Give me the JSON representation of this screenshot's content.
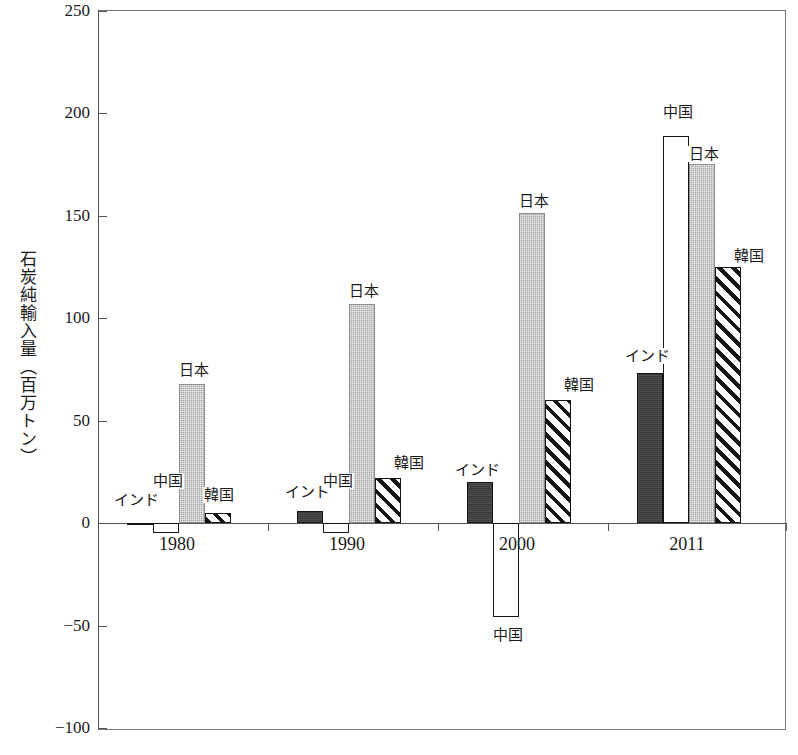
{
  "chart_data": {
    "type": "bar",
    "title": "",
    "subtitle": "",
    "xlabel": "",
    "ylabel": "石炭純輸入量（百万トン）",
    "categories": [
      "1980",
      "1990",
      "2000",
      "2011"
    ],
    "ylim": [
      -100,
      250
    ],
    "yticks": [
      250,
      200,
      150,
      100,
      50,
      0,
      -50,
      -100
    ],
    "ytick_labels": [
      "250",
      "200",
      "150",
      "100",
      "50",
      "0",
      "−50",
      "−100"
    ],
    "grid": false,
    "legend": "none (direct bar labels)",
    "series": [
      {
        "name": "インド",
        "key": "india",
        "fill": "dark-solid",
        "color": "#3a3a3a",
        "values": [
          -1,
          6,
          20,
          73
        ]
      },
      {
        "name": "中国",
        "key": "china",
        "fill": "white-outline",
        "color": "#ffffff",
        "values": [
          -5,
          -5,
          -46,
          189
        ]
      },
      {
        "name": "日本",
        "key": "japan",
        "fill": "gray-stipple",
        "color": "#a8a8a8",
        "values": [
          68,
          107,
          151,
          175
        ]
      },
      {
        "name": "韓国",
        "key": "korea",
        "fill": "diagonal-hatch",
        "color": "#ffffff",
        "values": [
          5,
          22,
          60,
          125
        ]
      }
    ],
    "bar_labels": [
      {
        "series": "インド",
        "category": "1980",
        "text": "インド"
      },
      {
        "series": "中国",
        "category": "1980",
        "text": "中国"
      },
      {
        "series": "日本",
        "category": "1980",
        "text": "日本"
      },
      {
        "series": "韓国",
        "category": "1980",
        "text": "韓国"
      },
      {
        "series": "インド",
        "category": "1990",
        "text": "インド"
      },
      {
        "series": "中国",
        "category": "1990",
        "text": "中国"
      },
      {
        "series": "日本",
        "category": "1990",
        "text": "日本"
      },
      {
        "series": "韓国",
        "category": "1990",
        "text": "韓国"
      },
      {
        "series": "インド",
        "category": "2000",
        "text": "インド"
      },
      {
        "series": "中国",
        "category": "2000",
        "text": "中国"
      },
      {
        "series": "日本",
        "category": "2000",
        "text": "日本"
      },
      {
        "series": "韓国",
        "category": "2000",
        "text": "韓国"
      },
      {
        "series": "インド",
        "category": "2011",
        "text": "インド"
      },
      {
        "series": "中国",
        "category": "2011",
        "text": "中国"
      },
      {
        "series": "日本",
        "category": "2011",
        "text": "日本"
      },
      {
        "series": "韓国",
        "category": "2011",
        "text": "韓国"
      }
    ]
  },
  "axis": {
    "y_title": "石炭純輸入量（百万トン）",
    "y_ticks": [
      {
        "value": 250,
        "label": "250"
      },
      {
        "value": 200,
        "label": "200"
      },
      {
        "value": 150,
        "label": "150"
      },
      {
        "value": 100,
        "label": "100"
      },
      {
        "value": 50,
        "label": "50"
      },
      {
        "value": 0,
        "label": "0"
      },
      {
        "value": -50,
        "label": "−50"
      },
      {
        "value": -100,
        "label": "−100"
      }
    ],
    "x_ticks": [
      {
        "label": "1980"
      },
      {
        "label": "1990"
      },
      {
        "label": "2000"
      },
      {
        "label": "2011"
      }
    ]
  },
  "labels": {
    "india": "インド",
    "china": "中国",
    "japan": "日本",
    "korea": "韓国"
  }
}
